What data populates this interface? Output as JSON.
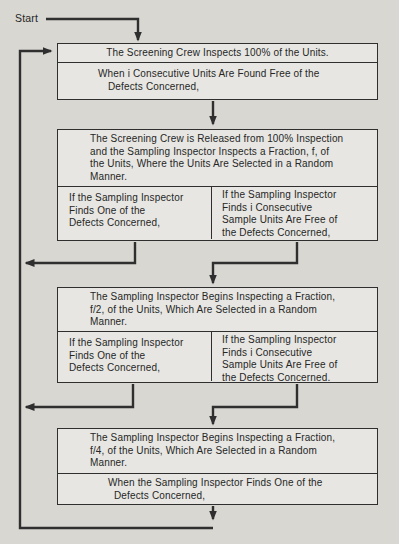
{
  "colors": {
    "page_background": "#d8d7d2",
    "box_fill": "#e7e6e2",
    "line": "#2f2f2f",
    "text": "#262626"
  },
  "flowchart": {
    "start_label": "Start",
    "box1": {
      "inspect": "The Screening Crew Inspects 100% of the Units.",
      "event": "When i Consecutive Units Are Found Free of the\nDefects Concerned,"
    },
    "box2": {
      "main": "The Screening Crew is Released from 100% Inspection\nand the Sampling Inspector Inspects a Fraction, f, of\nthe Units, Where the Units Are Selected in a Random\nManner.",
      "left": "If the Sampling Inspector\nFinds One of the\nDefects Concerned,",
      "right": "If the Sampling Inspector\nFinds i Consecutive\nSample Units Are Free of\nthe Defects Concerned,"
    },
    "box3": {
      "main": "The Sampling Inspector Begins Inspecting a Fraction,\nf/2, of the Units, Which Are Selected in a Random\nManner.",
      "left": "If the Sampling Inspector\nFinds One of the\nDefects Concerned,",
      "right": "If the Sampling Inspector\nFinds i Consecutive\nSample Units Are Free of\nthe Defects Concerned,"
    },
    "box4": {
      "main": "The Sampling Inspector Begins Inspecting a Fraction,\nf/4, of the Units, Which Are Selected in a Random\nManner.",
      "event": "When the Sampling Inspector Finds One of the\nDefects Concerned,"
    }
  }
}
